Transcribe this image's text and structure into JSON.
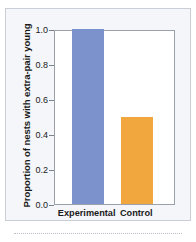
{
  "chart_data": {
    "type": "bar",
    "title": "",
    "xlabel": "",
    "ylabel": "Proportion of nests with extra-pair young",
    "categories": [
      "Experimental",
      "Control"
    ],
    "values": [
      1.0,
      0.5
    ],
    "series": [
      {
        "name": "Proportion of nests with extra-pair young",
        "values": [
          1.0,
          0.5
        ]
      }
    ],
    "ylim": [
      0.0,
      1.0
    ],
    "yticks": [
      "0.0",
      "0.2",
      "0.4",
      "0.6",
      "0.8",
      "1.0"
    ],
    "ytick_values": [
      0.0,
      0.2,
      0.4,
      0.6,
      0.8,
      1.0
    ],
    "grid": false,
    "legend": "none",
    "bar_colors": [
      "#7b92cc",
      "#f2a73e"
    ],
    "frame_color": "#9aa1ac",
    "panel_background": "#f4f6f9",
    "plot_background": "#ffffff"
  }
}
